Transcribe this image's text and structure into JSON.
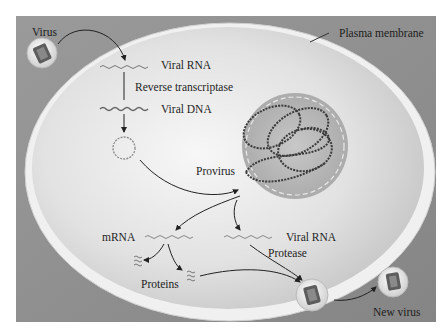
{
  "diagram": {
    "labels": {
      "virus": "Virus",
      "plasma_membrane": "Plasma membrane",
      "viral_rna_top": "Viral RNA",
      "reverse_transcriptase": "Reverse transcriptase",
      "viral_dna": "Viral DNA",
      "provirus": "Provirus",
      "mrna": "mRNA",
      "viral_rna_bottom": "Viral RNA",
      "protease": "Protease",
      "proteins": "Proteins",
      "new_virus": "New virus"
    },
    "colors": {
      "outer_bg": "#8f8f8f",
      "cell_fill": "#e6e6e6",
      "membrane": "#f2f2f2",
      "nucleus": "#b5b5b5",
      "dna_strand": "#3a3a3a",
      "arrow": "#222222",
      "text": "#1e1e1e"
    }
  }
}
